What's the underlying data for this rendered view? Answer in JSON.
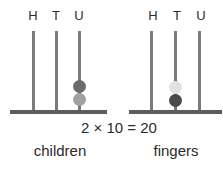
{
  "equation": "2 × 10 = 20",
  "abacus_left": {
    "caption": "children",
    "columns": [
      "H",
      "T",
      "U"
    ],
    "beads": {
      "column": "U",
      "top_color": "#6b6b6b",
      "bottom_color": "#a0a0a0"
    }
  },
  "abacus_right": {
    "caption": "fingers",
    "columns": [
      "H",
      "T",
      "U"
    ],
    "beads": {
      "column": "T",
      "top_color": "#e2e2e1",
      "bottom_color": "#4a4a4a"
    }
  },
  "colors": {
    "rod": "#7b7b7b",
    "base_bar": "#5d5d5d",
    "text": "#2b2b2b"
  }
}
